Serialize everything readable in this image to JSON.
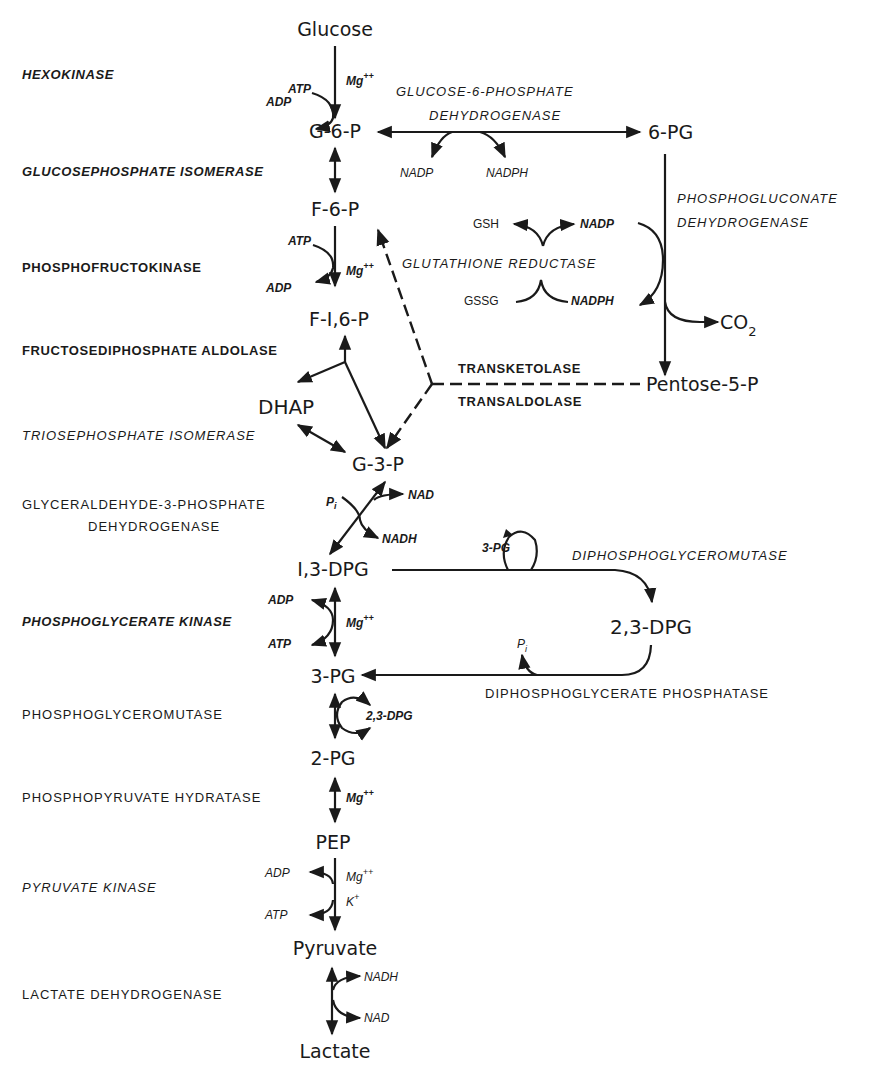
{
  "diagram": {
    "type": "metabolic-pathway"
  },
  "metabolites": {
    "glucose": "Glucose",
    "g6p": "G-6-P",
    "f6p": "F-6-P",
    "f16p": "F-I,6-P",
    "dhap": "DHAP",
    "g3p": "G-3-P",
    "dpg13": "I,3-DPG",
    "pg3": "3-PG",
    "pg2": "2-PG",
    "pep": "PEP",
    "pyruvate": "Pyruvate",
    "lactate": "Lactate",
    "pg6": "6-PG",
    "pentose5p": "Pentose-5-P",
    "co2": "CO",
    "co2_sub": "2",
    "dpg23": "2,3-DPG"
  },
  "enzymes": {
    "hexokinase": "HEXOKINASE",
    "gpi": "GLUCOSEPHOSPHATE  ISOMERASE",
    "pfk": "PHOSPHOFRUCTOKINASE",
    "aldolase": "FRUCTOSEDIPHOSPHATE  ALDOLASE",
    "tpi": "TRIOSEPHOSPHATE  ISOMERASE",
    "gapdh_1": "GLYCERALDEHYDE-3-PHOSPHATE",
    "gapdh_2": "DEHYDROGENASE",
    "pgk": "PHOSPHOGLYCERATE  KINASE",
    "pgm": "PHOSPHOGLYCEROMUTASE",
    "enolase": "PHOSPHOPYRUVATE  HYDRATASE",
    "pk": "PYRUVATE  KINASE",
    "ldh": "LACTATE  DEHYDROGENASE",
    "g6pd_1": "GLUCOSE-6-PHOSPHATE",
    "g6pd_2": "DEHYDROGENASE",
    "pgd_1": "PHOSPHOGLUCONATE",
    "pgd_2": "DEHYDROGENASE",
    "gr": "GLUTATHIONE  REDUCTASE",
    "transketolase": "TRANSKETOLASE",
    "transaldolase": "TRANSALDOLASE",
    "dpgm": "DIPHOSPHOGLYCEROMUTASE",
    "dpgp": "DIPHOSPHOGLYCERATE  PHOSPHATASE"
  },
  "cofactors": {
    "hk_atp": "ATP",
    "hk_adp": "ADP",
    "hk_mg": "Mg",
    "mg_sup": "++",
    "g6pd_nadp": "NADP",
    "g6pd_nadph": "NADPH",
    "pfk_atp": "ATP",
    "pfk_adp": "ADP",
    "pfk_mg": "Mg",
    "gr_gsh": "GSH",
    "gr_gssg": "GSSG",
    "gr_nadp": "NADP",
    "gr_nadph": "NADPH",
    "gapdh_pi": "P",
    "gapdh_pi_sub": "i",
    "gapdh_nad": "NAD",
    "gapdh_nadh": "NADH",
    "dpgm_3pg": "3-PG",
    "dpgp_pi": "P",
    "dpgp_pi_sub": "i",
    "pgk_adp": "ADP",
    "pgk_atp": "ATP",
    "pgk_mg": "Mg",
    "pgm_23dpg": "2,3-DPG",
    "eno_mg": "Mg",
    "pk_adp": "ADP",
    "pk_atp": "ATP",
    "pk_mg": "Mg",
    "pk_k": "K",
    "k_sup": "+",
    "ldh_nadh": "NADH",
    "ldh_nad": "NAD"
  }
}
